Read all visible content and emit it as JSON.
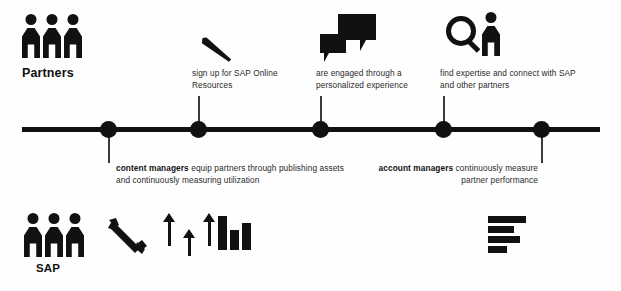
{
  "diagram": {
    "accent_color": "#111111",
    "background_color": "#fefefe",
    "text_color": "#2a2a2a"
  },
  "lanes": {
    "top": {
      "label": "Partners"
    },
    "bottom": {
      "label": "SAP"
    }
  },
  "timeline": {
    "dot_count": 5,
    "dots": [
      {
        "index": 1,
        "x": 100,
        "connector": "down"
      },
      {
        "index": 2,
        "x": 190,
        "connector": "up"
      },
      {
        "index": 3,
        "x": 312,
        "connector": "up"
      },
      {
        "index": 4,
        "x": 435,
        "connector": "up"
      },
      {
        "index": 5,
        "x": 533,
        "connector": "down"
      }
    ]
  },
  "top_captions": [
    {
      "id": "sign-up",
      "text": "sign up for SAP Online Resources",
      "icon": "pen-icon"
    },
    {
      "id": "engaged",
      "text": "are engaged through a personalized experience",
      "icon": "speech-bubbles-icon"
    },
    {
      "id": "find-expertise",
      "text": "find expertise and connect with SAP and other partners",
      "icon": "magnifier-person-icon"
    }
  ],
  "bottom_captions": [
    {
      "id": "content-managers",
      "bold": "content managers",
      "rest": " equip partners through publishing assets and continuously measuring utilization",
      "align": "left"
    },
    {
      "id": "account-managers",
      "bold": "account managers",
      "rest": " continuously measure partner performance",
      "align": "right"
    }
  ],
  "bottom_icons": [
    {
      "id": "wrench",
      "name": "wrench-icon"
    },
    {
      "id": "arrows",
      "name": "up-arrows-icon",
      "count": 3
    },
    {
      "id": "vbars",
      "name": "bar-chart-icon",
      "bars": [
        26,
        15,
        20
      ]
    },
    {
      "id": "hbars",
      "name": "horizontal-bar-chart-icon",
      "bars": [
        38,
        26,
        32,
        19
      ]
    }
  ]
}
